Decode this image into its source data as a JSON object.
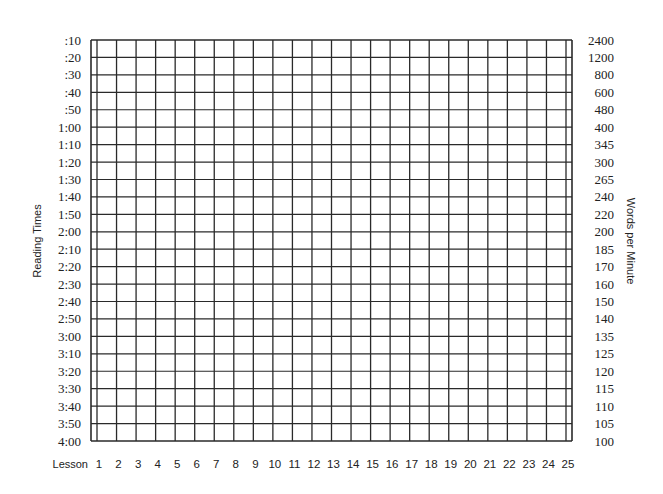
{
  "chart_data": {
    "type": "table",
    "title": "",
    "xlabel": "Lesson",
    "ylabel_left": "Reading Times",
    "ylabel_right": "Words per Minute",
    "x_ticks": [
      "1",
      "2",
      "3",
      "4",
      "5",
      "6",
      "7",
      "8",
      "9",
      "10",
      "11",
      "12",
      "13",
      "14",
      "15",
      "16",
      "17",
      "18",
      "19",
      "20",
      "21",
      "22",
      "23",
      "24",
      "25"
    ],
    "y_ticks_left": [
      ":10",
      ":20",
      ":30",
      ":40",
      ":50",
      "1:00",
      "1:10",
      "1:20",
      "1:30",
      "1:40",
      "1:50",
      "2:00",
      "2:10",
      "2:20",
      "2:30",
      "2:40",
      "2:50",
      "3:00",
      "3:10",
      "3:20",
      "3:30",
      "3:40",
      "3:50",
      "4:00"
    ],
    "y_ticks_right": [
      "2400",
      "1200",
      "800",
      "600",
      "480",
      "400",
      "345",
      "300",
      "265",
      "240",
      "220",
      "200",
      "185",
      "170",
      "160",
      "150",
      "140",
      "135",
      "125",
      "120",
      "115",
      "110",
      "105",
      "100"
    ],
    "grid": true,
    "legend": null,
    "series": []
  },
  "colors": {
    "grid_line": "#2a2a2a",
    "text": "#222222",
    "background": "#ffffff"
  }
}
